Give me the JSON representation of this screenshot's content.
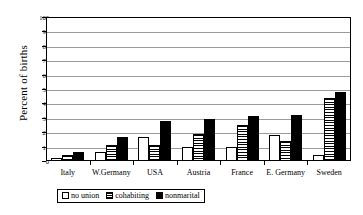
{
  "chart_data": {
    "type": "bar",
    "title": "",
    "xlabel": "",
    "ylabel": "Percent of births",
    "ylim": [
      0,
      100
    ],
    "ytick_step": 10,
    "yticks": [
      0,
      10,
      20,
      30,
      40,
      50,
      60,
      70,
      80,
      90,
      100
    ],
    "grid": true,
    "legend_position": "bottom",
    "categories": [
      "Italy",
      "W.Germany",
      "USA",
      "Austria",
      "France",
      "E. Germany",
      "Sweden"
    ],
    "series": [
      {
        "name": "no union",
        "style": "white",
        "values": [
          2,
          6,
          17,
          10,
          10,
          18,
          4
        ]
      },
      {
        "name": "cohabiting",
        "style": "hatched",
        "values": [
          4,
          11,
          11,
          19,
          25,
          14,
          44
        ]
      },
      {
        "name": "nonmarital",
        "style": "black",
        "values": [
          6,
          17,
          28,
          29,
          31,
          32,
          48
        ]
      }
    ]
  },
  "legend": {
    "items": [
      {
        "label": "no union"
      },
      {
        "label": "cohabiting"
      },
      {
        "label": "nonmarital"
      }
    ]
  },
  "colors": {
    "axis": "#000000",
    "gridline": "#9a9a9a",
    "background": "#ffffff",
    "bar_black": "#000000",
    "bar_white": "#ffffff"
  }
}
